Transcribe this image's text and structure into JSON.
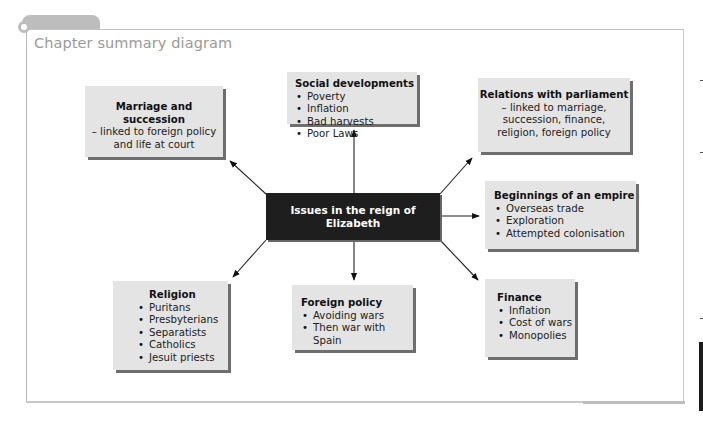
{
  "header": {
    "title": "Chapter summary diagram"
  },
  "diagram": {
    "central": {
      "label": "Issues in the reign of Elizabeth"
    },
    "nodes": {
      "marriage": {
        "title": "Marriage and succession",
        "lines": [
          "– linked to foreign policy",
          "and life at court"
        ]
      },
      "social": {
        "title": "Social developments",
        "items": [
          "Poverty",
          "Inflation",
          "Bad harvests",
          "Poor Laws"
        ]
      },
      "parliament": {
        "title": "Relations with parliament",
        "lines": [
          "– linked to marriage,",
          "succession, finance,",
          "religion, foreign policy"
        ]
      },
      "empire": {
        "title": "Beginnings of an empire",
        "items": [
          "Overseas trade",
          "Exploration",
          "Attempted colonisation"
        ]
      },
      "religion": {
        "title": "Religion",
        "items": [
          "Puritans",
          "Presbyterians",
          "Separatists",
          "Catholics",
          "Jesuit priests"
        ]
      },
      "foreign": {
        "title": "Foreign policy",
        "items": [
          "Avoiding wars",
          "Then war with Spain"
        ]
      },
      "finance": {
        "title": "Finance",
        "items": [
          "Inflation",
          "Cost of wars",
          "Monopolies"
        ]
      }
    },
    "colors": {
      "box_fill": "#e4e4e4",
      "box_shadow": "#6e6e6e",
      "central_fill": "#1e1e1e",
      "frame": "#c4c4c4",
      "title_text": "#9a9a9a"
    }
  }
}
